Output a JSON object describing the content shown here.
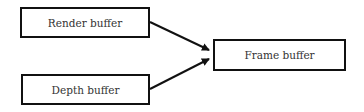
{
  "diagram": {
    "nodes": [
      {
        "id": "render",
        "label": "Render buffer"
      },
      {
        "id": "depth",
        "label": "Depth buffer"
      },
      {
        "id": "frame",
        "label": "Frame buffer"
      }
    ],
    "edges": [
      {
        "from": "render",
        "to": "frame"
      },
      {
        "from": "depth",
        "to": "frame"
      }
    ],
    "colors": {
      "stroke": "#111111",
      "text": "#333333",
      "background": "#ffffff"
    }
  }
}
